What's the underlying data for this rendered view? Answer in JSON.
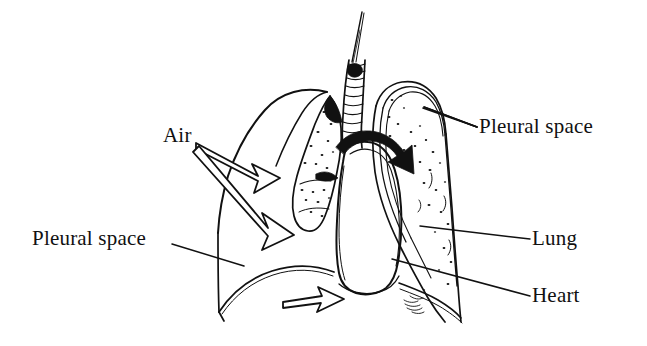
{
  "figure": {
    "type": "medical-line-diagram",
    "background_color": "#ffffff",
    "ink_color": "#111111"
  },
  "labels": {
    "pleural_space_right": "Pleural space",
    "lung": "Lung",
    "heart": "Heart",
    "pleural_space_left": "Pleural space",
    "air": "Air"
  },
  "annotations": {
    "arrow_black_curved": "air-entering-pleural-space-arrow",
    "arrow_hollow_upper": "air-escaping-arrow-upper",
    "arrow_hollow_lower": "air-escaping-arrow-lower",
    "arrow_hollow_diaphragm": "diaphragm-movement-arrow"
  },
  "structures": {
    "trachea": "trachea-with-needle",
    "left_lung": "collapsed-left-lung",
    "right_lung": "inflated-right-lung",
    "heart": "heart-outline",
    "diaphragm": "diaphragm-curve",
    "chest_wall": "chest-wall-outline",
    "pleural_lining": "pleural-double-line"
  }
}
